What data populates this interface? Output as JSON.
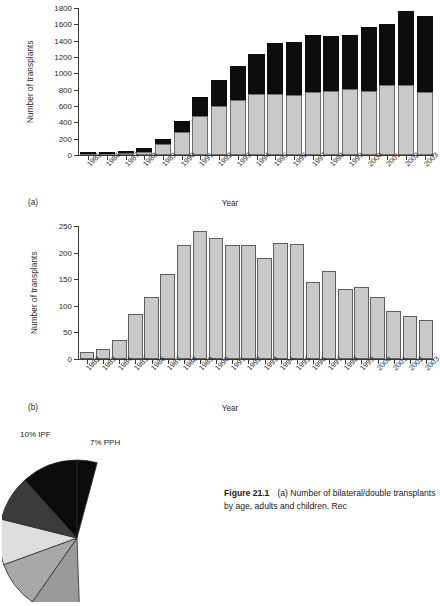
{
  "figure": {
    "caption_number": "Figure 21.1",
    "caption_line1": "(a) Number of bilateral/double",
    "caption_line2": "transplants by age, adults and children. Rec"
  },
  "panel_a": {
    "label": "(a)",
    "ylabel": "Number of transplants",
    "xlabel": "Year",
    "yticks": [
      "0",
      "200",
      "400",
      "600",
      "800",
      "1000",
      "1200",
      "1400",
      "1600",
      "1800"
    ]
  },
  "panel_b": {
    "label": "(b)",
    "ylabel": "Number of transplants",
    "xlabel": "Year",
    "yticks": [
      "0",
      "50",
      "100",
      "150",
      "200",
      "250"
    ]
  },
  "pie": {
    "labels": [
      {
        "text": "10% IPF",
        "left": 18,
        "top": -22
      },
      {
        "text": "7% PPH",
        "left": 88,
        "top": -14
      }
    ]
  },
  "chart_data": [
    {
      "type": "bar",
      "id": "panel_a",
      "title": "(a) Number of transplants by year",
      "stacked": true,
      "xlabel": "Year",
      "ylabel": "Number of transplants",
      "ylim": [
        0,
        1800
      ],
      "yticks": [
        0,
        200,
        400,
        600,
        800,
        1000,
        1200,
        1400,
        1600,
        1800
      ],
      "grid": false,
      "legend": "none",
      "categories": [
        "1985",
        "1986",
        "1987",
        "1988",
        "1989",
        "1990",
        "1991",
        "1992",
        "1993",
        "1994",
        "1995",
        "1996",
        "1997",
        "1998",
        "1999",
        "2000",
        "2001",
        "2002",
        "2003"
      ],
      "series": [
        {
          "name": "lower (grey)",
          "color": "#c9c9c9",
          "values": [
            8,
            8,
            30,
            35,
            140,
            285,
            480,
            600,
            670,
            745,
            745,
            740,
            775,
            780,
            805,
            780,
            860,
            855,
            770
          ]
        },
        {
          "name": "upper (black)",
          "color": "#0d0d0d",
          "values": [
            5,
            5,
            15,
            45,
            55,
            130,
            230,
            320,
            415,
            490,
            625,
            640,
            695,
            680,
            670,
            785,
            745,
            905,
            930
          ]
        }
      ],
      "totals": [
        13,
        13,
        45,
        80,
        195,
        415,
        710,
        920,
        1085,
        1235,
        1370,
        1380,
        1470,
        1460,
        1475,
        1565,
        1605,
        1760,
        1700
      ]
    },
    {
      "type": "bar",
      "id": "panel_b",
      "title": "(b) Number of transplants by year",
      "stacked": false,
      "xlabel": "Year",
      "ylabel": "Number of transplants",
      "ylim": [
        0,
        250
      ],
      "yticks": [
        0,
        50,
        100,
        150,
        200,
        250
      ],
      "grid": false,
      "legend": "none",
      "categories": [
        "1982",
        "1983",
        "1984",
        "1985",
        "1986",
        "1987",
        "1988",
        "1989",
        "1990",
        "1991",
        "1992",
        "1993",
        "1994",
        "1995",
        "1996",
        "1997",
        "1998",
        "1999",
        "2000",
        "2001",
        "2002",
        "2003"
      ],
      "values": [
        13,
        19,
        35,
        85,
        117,
        159,
        215,
        241,
        227,
        215,
        215,
        190,
        219,
        216,
        144,
        165,
        132,
        136,
        116,
        91,
        80,
        74
      ],
      "color": "#c9c9c9"
    },
    {
      "type": "pie",
      "id": "pie_chart",
      "title": "Indications for transplant",
      "labels": [
        "10% IPF",
        "7% PPH"
      ],
      "slices": [
        {
          "label": "10% IPF",
          "value": 10,
          "color": "#d9d9d9"
        },
        {
          "label": "7% PPH",
          "value": 7,
          "color": "#3b3b3b"
        }
      ]
    }
  ]
}
